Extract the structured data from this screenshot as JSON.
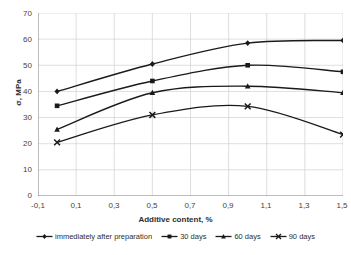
{
  "chart_data": {
    "type": "line",
    "title": "",
    "xlabel": "Additive content, %",
    "ylabel": "σ, MPa",
    "xlim": [
      -0.1,
      1.5
    ],
    "ylim": [
      0,
      70
    ],
    "grid": true,
    "legend_position": "bottom",
    "x_ticks": [
      "-0,1",
      "0,1",
      "0,3",
      "0,5",
      "0,7",
      "0,9",
      "1,1",
      "1,3",
      "1,5"
    ],
    "x_tick_values": [
      -0.1,
      0.1,
      0.3,
      0.5,
      0.7,
      0.9,
      1.1,
      1.3,
      1.5
    ],
    "y_ticks": [
      "0",
      "10",
      "20",
      "30",
      "40",
      "50",
      "60",
      "70"
    ],
    "y_tick_values": [
      0,
      10,
      20,
      30,
      40,
      50,
      60,
      70
    ],
    "x": [
      0,
      0.5,
      1.0,
      1.5
    ],
    "series": [
      {
        "name": "immediately after preparation",
        "marker": "diamond",
        "color": "#1a1a1a",
        "values": [
          40.0,
          50.5,
          58.5,
          59.5
        ]
      },
      {
        "name": "30 days",
        "marker": "square",
        "color": "#1a1a1a",
        "values": [
          34.5,
          44.0,
          50.0,
          47.5
        ]
      },
      {
        "name": "60 days",
        "marker": "triangle",
        "color": "#1a1a1a",
        "values": [
          25.5,
          39.5,
          42.0,
          39.5
        ]
      },
      {
        "name": "90 days",
        "marker": "x-cross",
        "color": "#1a1a1a",
        "values": [
          20.5,
          31.0,
          34.3,
          23.5
        ]
      }
    ]
  },
  "legend": {
    "items": [
      {
        "label": "immediately after preparation",
        "marker": "diamond"
      },
      {
        "label": "30 days",
        "marker": "square"
      },
      {
        "label": "60 days",
        "marker": "triangle"
      },
      {
        "label": "90 days",
        "marker": "x-cross"
      }
    ]
  },
  "colors": {
    "line": "#1a1a1a",
    "grid": "#d0d0d0",
    "axis": "#808080",
    "text": "#3f3f3f",
    "background": "#ffffff"
  }
}
